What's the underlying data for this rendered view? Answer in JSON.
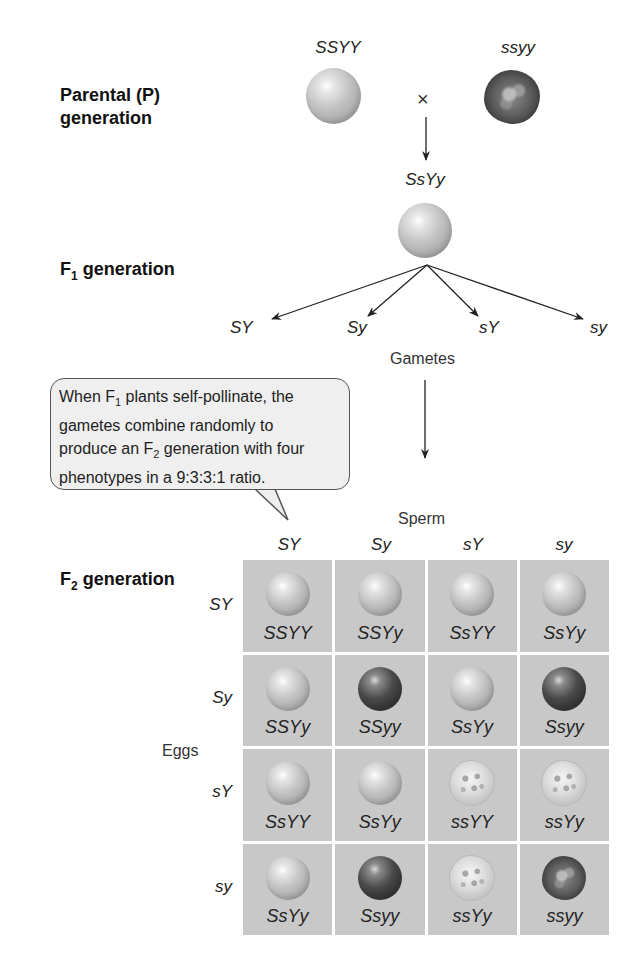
{
  "figure": {
    "parental": {
      "label_line1": "Parental (P)",
      "label_line2": "generation",
      "parent1_genotype": "SSYY",
      "parent1_phenotype": "yellow-round",
      "parent2_genotype": "ssyy",
      "parent2_phenotype": "green-wrinkled",
      "cross_symbol": "×"
    },
    "f1": {
      "label_prefix": "F",
      "label_sub": "1",
      "label_suffix": " generation",
      "genotype": "SsYy",
      "phenotype": "yellow-round",
      "gametes": [
        "SY",
        "Sy",
        "sY",
        "sy"
      ],
      "gametes_label": "Gametes"
    },
    "callout": {
      "line1_pre": "When F",
      "line1_sub": "1",
      "line1_post": " plants self-pollinate, the",
      "line2": "gametes combine randomly to",
      "line3_pre": "produce an F",
      "line3_sub": "2",
      "line3_post": " generation with four",
      "line4": "phenotypes in a 9:3:3:1 ratio."
    },
    "f2": {
      "label_prefix": "F",
      "label_sub": "2",
      "label_suffix": " generation",
      "sperm_label": "Sperm",
      "eggs_label": "Eggs",
      "column_headers": [
        "SY",
        "Sy",
        "sY",
        "sy"
      ],
      "row_headers": [
        "SY",
        "Sy",
        "sY",
        "sy"
      ],
      "cells": [
        [
          {
            "genotype": "SSYY",
            "phenotype": "yellow-round"
          },
          {
            "genotype": "SSYy",
            "phenotype": "yellow-round"
          },
          {
            "genotype": "SsYY",
            "phenotype": "yellow-round"
          },
          {
            "genotype": "SsYy",
            "phenotype": "yellow-round"
          }
        ],
        [
          {
            "genotype": "SSYy",
            "phenotype": "yellow-round"
          },
          {
            "genotype": "SSyy",
            "phenotype": "green-round"
          },
          {
            "genotype": "SsYy",
            "phenotype": "yellow-round"
          },
          {
            "genotype": "Ssyy",
            "phenotype": "green-round"
          }
        ],
        [
          {
            "genotype": "SsYY",
            "phenotype": "yellow-round"
          },
          {
            "genotype": "SsYy",
            "phenotype": "yellow-round"
          },
          {
            "genotype": "ssYY",
            "phenotype": "yellow-wrinkled"
          },
          {
            "genotype": "ssYy",
            "phenotype": "yellow-wrinkled"
          }
        ],
        [
          {
            "genotype": "SsYy",
            "phenotype": "yellow-round"
          },
          {
            "genotype": "Ssyy",
            "phenotype": "green-round"
          },
          {
            "genotype": "ssYy",
            "phenotype": "yellow-wrinkled"
          },
          {
            "genotype": "ssyy",
            "phenotype": "green-wrinkled"
          }
        ]
      ]
    }
  }
}
